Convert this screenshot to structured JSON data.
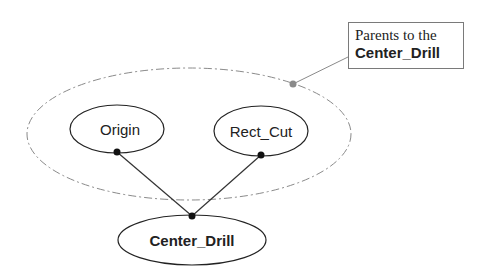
{
  "diagram": {
    "group": {
      "label_line1": "Parents to the",
      "label_line2": "Center_Drill",
      "border_color": "#8a8a8a",
      "connector_dot_color": "#8a8a8a"
    },
    "nodes": [
      {
        "id": "origin",
        "label": "Origin",
        "bold": false
      },
      {
        "id": "rect_cut",
        "label": "Rect_Cut",
        "bold": false
      },
      {
        "id": "center_drill",
        "label": "Center_Drill",
        "bold": true
      }
    ],
    "edges": [
      {
        "from": "origin",
        "to": "center_drill"
      },
      {
        "from": "rect_cut",
        "to": "center_drill"
      }
    ],
    "colors": {
      "node_stroke": "#222222",
      "edge": "#333333",
      "dot": "#111111"
    }
  }
}
